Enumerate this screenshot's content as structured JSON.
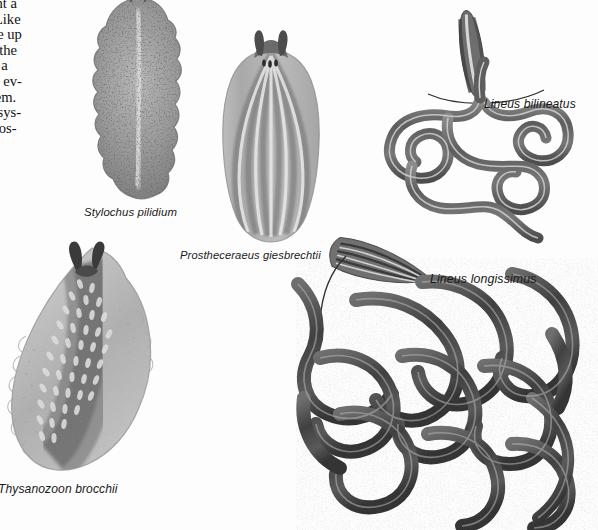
{
  "page": {
    "background_color": "#fdfdfd",
    "ink_color": "#1a1a1a"
  },
  "body_text": {
    "lines": [
      "resent a",
      "on. Like",
      "made up",
      "reas the",
      "g by a",
      "have ev-",
      "system.",
      "ood sys-",
      "probos-"
    ],
    "note": "column clipped at the left page edge"
  },
  "figures": [
    {
      "id": "stylochus",
      "caption": "Stylochus pilidium",
      "kind": "polyclad-flatworm",
      "description": "dark speckled oval flatworm with ruffled lateral margins",
      "tone": "#8d8d8d"
    },
    {
      "id": "prostheceraeus",
      "caption": "Prostheceraeus giesbrechtii",
      "kind": "polyclad-flatworm",
      "description": "longitudinally striped flatworm with a pair of head tentacles and dark eyespots",
      "tone": "#9b9b9b"
    },
    {
      "id": "thysanozoon",
      "caption": "Thysanozoon brocchii",
      "kind": "polyclad-flatworm",
      "description": "papillated flatworm with dark horn-like tentacles and frilled margin",
      "tone": "#a2a2a2"
    },
    {
      "id": "lineus-bilineatus",
      "caption": "Lineus bilineatus",
      "kind": "nemertean-ribbon-worm",
      "description": "coiled ribbon worm with enlarged head inset above",
      "tone": "#6f6f6f",
      "inset": "magnified anterior end"
    },
    {
      "id": "lineus-longissimus",
      "caption": "Lineus longissimus",
      "kind": "nemertean-ribbon-worm",
      "description": "dense tangled mass of long dark ribbon worms with enlarged head inset",
      "tone": "#5a5a5a",
      "inset": "magnified anterior end"
    }
  ]
}
